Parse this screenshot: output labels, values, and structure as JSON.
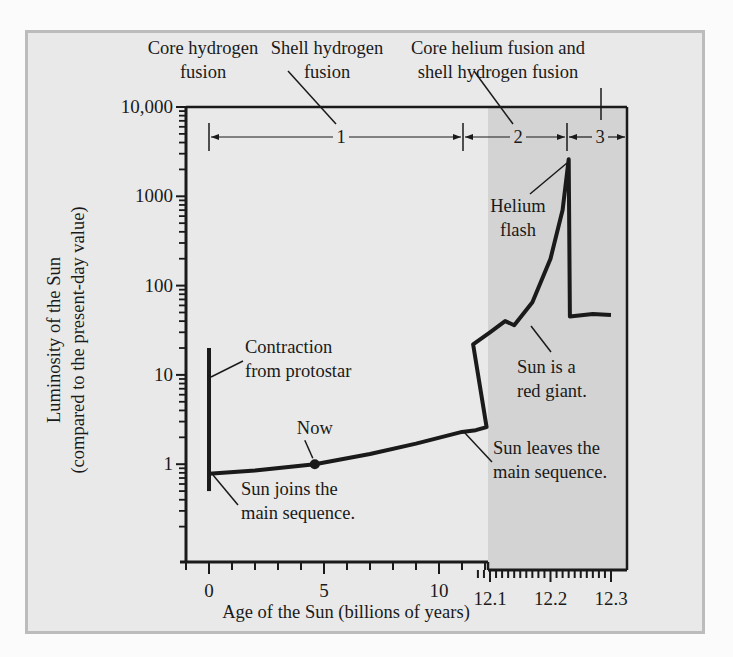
{
  "chart_data": {
    "type": "line",
    "title": "",
    "xlabel": "Age of the Sun (billions of years)",
    "ylabel": "Luminosity of the Sun",
    "ylabel_sub": "(compared to the present-day value)",
    "yscale": "log",
    "ylim": [
      0.08,
      10000
    ],
    "y_ticks": [
      {
        "value": 10000,
        "label": "10,000"
      },
      {
        "value": 1000,
        "label": "1000"
      },
      {
        "value": 100,
        "label": "100"
      },
      {
        "value": 10,
        "label": "10"
      },
      {
        "value": 1,
        "label": "1"
      }
    ],
    "x_segments": [
      {
        "range": [
          -1,
          12.07
        ],
        "ticks": [
          {
            "value": 0,
            "label": "0"
          },
          {
            "value": 5,
            "label": "5"
          },
          {
            "value": 10,
            "label": "10"
          }
        ]
      },
      {
        "range": [
          12.07,
          12.3
        ],
        "ticks": [
          {
            "value": 12.1,
            "label": "12.1"
          },
          {
            "value": 12.2,
            "label": "12.2"
          },
          {
            "value": 12.3,
            "label": "12.3"
          }
        ],
        "shaded": true
      }
    ],
    "grid": false,
    "series": [
      {
        "name": "Sun luminosity",
        "points": [
          {
            "x": 0,
            "y": 0.78
          },
          {
            "x": 2,
            "y": 0.85
          },
          {
            "x": 4.6,
            "y": 1.0
          },
          {
            "x": 7,
            "y": 1.3
          },
          {
            "x": 9,
            "y": 1.7
          },
          {
            "x": 11,
            "y": 2.3
          },
          {
            "x": 11.6,
            "y": 2.4
          },
          {
            "x": 12.07,
            "y": 2.6
          },
          {
            "x": 12.072,
            "y": 22
          },
          {
            "x": 12.1,
            "y": 30
          },
          {
            "x": 12.125,
            "y": 40
          },
          {
            "x": 12.14,
            "y": 36
          },
          {
            "x": 12.17,
            "y": 65
          },
          {
            "x": 12.2,
            "y": 200
          },
          {
            "x": 12.22,
            "y": 700
          },
          {
            "x": 12.23,
            "y": 2600
          },
          {
            "x": 12.232,
            "y": 45
          },
          {
            "x": 12.27,
            "y": 48
          },
          {
            "x": 12.3,
            "y": 47
          }
        ]
      },
      {
        "name": "Contraction from protostar",
        "points": [
          {
            "x": 0,
            "y": 20
          },
          {
            "x": 0,
            "y": 0.5
          }
        ]
      }
    ],
    "markers": [
      {
        "name": "now",
        "x": 4.6,
        "y": 1.0,
        "label": "Now"
      }
    ],
    "annotations": [
      {
        "id": "contraction",
        "text": [
          "Contraction",
          "from protostar"
        ]
      },
      {
        "id": "joins",
        "text": [
          "Sun joins the",
          "main sequence."
        ]
      },
      {
        "id": "leaves",
        "text": [
          "Sun leaves the",
          "main sequence."
        ]
      },
      {
        "id": "red-giant",
        "text": [
          "Sun is a",
          "red giant."
        ]
      },
      {
        "id": "helium-flash",
        "text": [
          "Helium",
          "flash"
        ]
      }
    ],
    "phases": [
      {
        "number": "1",
        "label": [
          "Core hydrogen",
          "fusion"
        ],
        "x_start": 0,
        "x_end": 11.6
      },
      {
        "number": "2",
        "label": [
          "Shell hydrogen",
          "fusion"
        ],
        "x_start": 11.6,
        "x_end": 12.23
      },
      {
        "number": "3",
        "label": [
          "Core helium fusion and",
          "shell hydrogen fusion"
        ],
        "x_start": 12.23,
        "x_end": 12.3
      }
    ],
    "colors": {
      "panel": "#e9e9e9",
      "panel_border": "#bcbcbc",
      "shaded_region": "#d3d3d3",
      "line": "#1a1a1a"
    }
  }
}
